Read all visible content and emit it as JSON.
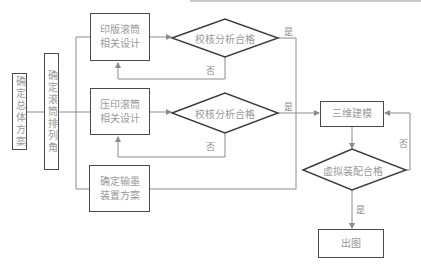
{
  "nodes": {
    "overall_plan": "确定总体方案",
    "roller_angle": "确定滚筒排列角",
    "plate_roller": "印版滚筒\n相关设计",
    "impression_roller": "压印滚筒\n相关设计",
    "ink_frame": "确定输墨\n装置方案",
    "check1": "校核分析合格",
    "check2": "校核分析合格",
    "modeling_3d": "三维建模",
    "virtual_assembly": "虚拟装配合格",
    "output_drawing": "出图"
  },
  "edge_labels": {
    "yes1": "是",
    "no1": "否",
    "yes2": "是",
    "no2": "否",
    "no3": "否",
    "yes3": "是"
  },
  "colors": {
    "border": "#4a4a4a",
    "line": "#8c8c8c",
    "text": "#9a9a9a"
  }
}
